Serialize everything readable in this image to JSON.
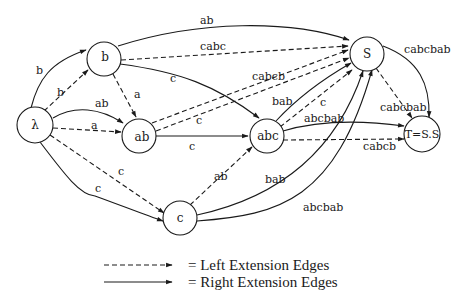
{
  "diagram": {
    "type": "graph",
    "nodes": [
      {
        "id": "lambda",
        "label": "λ"
      },
      {
        "id": "b",
        "label": "b"
      },
      {
        "id": "ab",
        "label": "ab"
      },
      {
        "id": "abc",
        "label": "abc"
      },
      {
        "id": "c",
        "label": "c"
      },
      {
        "id": "S",
        "label": "S"
      },
      {
        "id": "T",
        "label": "T=S.S"
      }
    ],
    "edges": [
      {
        "from": "lambda",
        "to": "b",
        "label": "b",
        "style": "solid"
      },
      {
        "from": "lambda",
        "to": "b",
        "label": "b",
        "style": "dashed"
      },
      {
        "from": "lambda",
        "to": "ab",
        "label": "ab",
        "style": "solid"
      },
      {
        "from": "lambda",
        "to": "ab",
        "label": "a",
        "style": "dashed"
      },
      {
        "from": "lambda",
        "to": "c",
        "label": "c",
        "style": "solid"
      },
      {
        "from": "lambda",
        "to": "c",
        "label": "c",
        "style": "dashed"
      },
      {
        "from": "b",
        "to": "S",
        "label": "ab",
        "style": "solid"
      },
      {
        "from": "b",
        "to": "S",
        "label": "cabc",
        "style": "dashed"
      },
      {
        "from": "b",
        "to": "abc",
        "label": "c",
        "style": "solid"
      },
      {
        "from": "b",
        "to": "ab",
        "label": "a",
        "style": "dashed"
      },
      {
        "from": "ab",
        "to": "abc",
        "label": "c",
        "style": "solid"
      },
      {
        "from": "ab",
        "to": "S",
        "label": "cabcb",
        "style": "dashed"
      },
      {
        "from": "ab",
        "to": "S",
        "label": "c",
        "style": "dashed"
      },
      {
        "from": "abc",
        "to": "S",
        "label": "bab",
        "style": "solid"
      },
      {
        "from": "abc",
        "to": "S",
        "label": "c",
        "style": "dashed"
      },
      {
        "from": "abc",
        "to": "T",
        "label": "abcbab",
        "style": "solid"
      },
      {
        "from": "abc",
        "to": "T",
        "label": "cabcb",
        "style": "dashed"
      },
      {
        "from": "c",
        "to": "abc",
        "label": "ab",
        "style": "dashed"
      },
      {
        "from": "c",
        "to": "S",
        "label": "bab",
        "style": "solid"
      },
      {
        "from": "c",
        "to": "S",
        "label": "abcbab",
        "style": "solid"
      },
      {
        "from": "S",
        "to": "T",
        "label": "cabcbab",
        "style": "solid"
      },
      {
        "from": "S",
        "to": "T",
        "label": "cabcbab",
        "style": "dashed"
      }
    ]
  },
  "labels": {
    "e_lam_b_solid": "b",
    "e_lam_b_dash": "b",
    "e_lam_ab_solid": "ab",
    "e_lam_ab_dash": "a",
    "e_lam_c_solid": "c",
    "e_lam_c_dash": "c",
    "e_b_S_solid": "ab",
    "e_b_S_dash": "cabc",
    "e_b_abc_solid": "c",
    "e_b_ab_dash": "a",
    "e_ab_abc_solid": "c",
    "e_ab_S_dash1": "cabcb",
    "e_ab_S_dash2": "c",
    "e_abc_S_solid": "bab",
    "e_abc_S_dash": "c",
    "e_abc_T_solid": "abcbab",
    "e_abc_T_dash": "cabcb",
    "e_c_abc_dash": "ab",
    "e_c_S_solid1": "bab",
    "e_c_S_solid2": "abcbab",
    "e_S_T_solid": "cabcbab",
    "e_S_T_dash": "cabcbab"
  },
  "nodes": {
    "lambda": "λ",
    "b": "b",
    "ab": "ab",
    "abc": "abc",
    "c": "c",
    "S": "S",
    "T": "T=S.S"
  },
  "legend": {
    "left": "= Left Extension Edges",
    "right": "= Right Extension Edges"
  }
}
